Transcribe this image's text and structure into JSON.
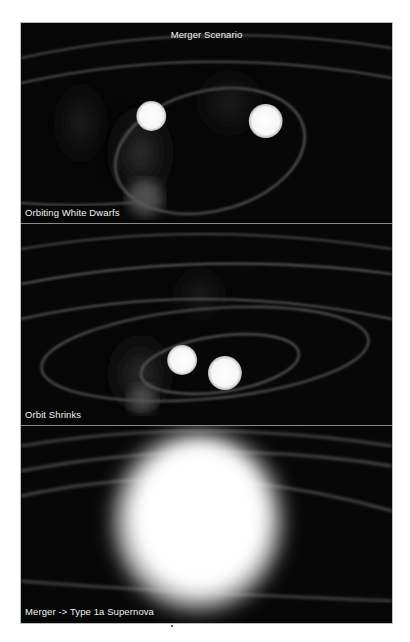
{
  "figure": {
    "title": "Merger Scenario",
    "panels": [
      {
        "label": "Orbiting White Dwarfs",
        "objects": [
          {
            "name": "white-dwarf-1"
          },
          {
            "name": "white-dwarf-2"
          }
        ]
      },
      {
        "label": "Orbit Shrinks",
        "objects": [
          {
            "name": "white-dwarf-1"
          },
          {
            "name": "white-dwarf-2"
          }
        ]
      },
      {
        "label": "Merger -> Type 1a Supernova",
        "objects": [
          {
            "name": "supernova-explosion"
          }
        ]
      }
    ]
  },
  "colors": {
    "background": "#070707",
    "star": "#ffffff",
    "orbit": "#5a5a5a",
    "text": "#f2f2f2",
    "divider": "#8a8a8a"
  }
}
